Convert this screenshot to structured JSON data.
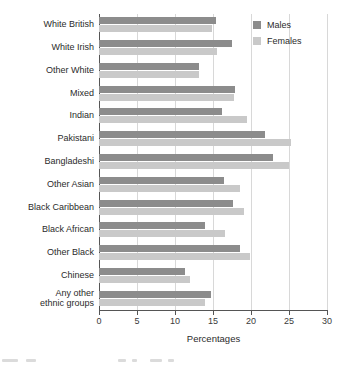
{
  "chart_data": {
    "type": "bar",
    "orientation": "horizontal",
    "title": "",
    "xlabel": "Percentages",
    "ylabel": "",
    "xlim": [
      0,
      30
    ],
    "xticks": [
      0,
      5,
      10,
      15,
      20,
      25,
      30
    ],
    "xtick_labels": [
      "0",
      "5",
      "10",
      "15",
      "20",
      "25",
      "30"
    ],
    "grid": "vertical",
    "legend_position": "top-right",
    "categories": [
      "White British",
      "White Irish",
      "Other White",
      "Mixed",
      "Indian",
      "Pakistani",
      "Bangladeshi",
      "Other Asian",
      "Black Caribbean",
      "Black African",
      "Other Black",
      "Chinese",
      "Any other\nethnic groups"
    ],
    "series": [
      {
        "name": "Males",
        "color": "#8c8c8c",
        "values": [
          15.4,
          17.5,
          13.1,
          17.9,
          16.2,
          21.9,
          22.9,
          16.5,
          17.6,
          14.0,
          18.6,
          11.3,
          14.8
        ]
      },
      {
        "name": "Females",
        "color": "#c9c9c9",
        "values": [
          14.9,
          15.5,
          13.1,
          17.7,
          19.5,
          25.2,
          25.0,
          18.6,
          19.1,
          16.6,
          19.9,
          12.0,
          14.0
        ]
      }
    ]
  },
  "legend": {
    "items": [
      {
        "label": "Males",
        "color": "#8c8c8c"
      },
      {
        "label": "Females",
        "color": "#c9c9c9"
      }
    ]
  },
  "axis": {
    "x_title": "Percentages"
  }
}
